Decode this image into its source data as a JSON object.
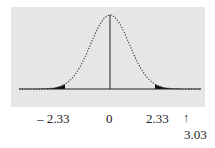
{
  "chart_data": {
    "type": "area",
    "title": "",
    "distribution": "standard normal",
    "mean": 0,
    "critical_values": [
      -2.33,
      2.33
    ],
    "shaded_regions": [
      {
        "name": "left-tail",
        "from": "-inf",
        "to": -2.33
      },
      {
        "name": "right-tail",
        "from": 2.33,
        "to": "+inf"
      }
    ],
    "annotations": [
      {
        "text": "3.03",
        "x": 3.03,
        "marker": "up-arrow"
      }
    ],
    "tick_labels": [
      "– 2.33",
      "0",
      "2.33"
    ],
    "xlabel": "",
    "ylabel": "",
    "grid": false,
    "legend": null,
    "colors": {
      "background": "#e6e6e6",
      "fill": "#111111",
      "curve": "#333333"
    }
  },
  "labels": {
    "neg_crit": "– 2.33",
    "zero": "0",
    "pos_crit": "2.33",
    "arrow": "↑",
    "test_stat": "3.03"
  }
}
